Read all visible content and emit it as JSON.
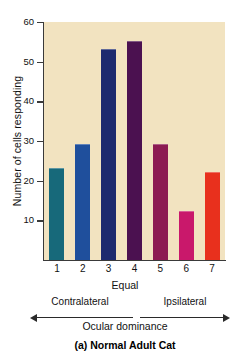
{
  "chart_data": {
    "type": "bar",
    "title": "",
    "caption": "(a)  Normal Adult Cat",
    "xlabel": "Ocular dominance",
    "ylabel": "Number of cells responding",
    "categories": [
      "1",
      "2",
      "3",
      "4",
      "5",
      "6",
      "7"
    ],
    "values": [
      23,
      29,
      53,
      55,
      29,
      12,
      22
    ],
    "bar_colors": [
      "#17697a",
      "#1f4f9c",
      "#1d2a6e",
      "#4b1150",
      "#8c1b52",
      "#c9186b",
      "#e8301d"
    ],
    "ylim": [
      0,
      60
    ],
    "yticks": [
      10,
      20,
      30,
      40,
      50,
      60
    ],
    "ytick_labels": [
      "10",
      "20",
      "30",
      "40",
      "50",
      "60"
    ],
    "grid": false,
    "legend": "none",
    "plot_background": "#f2e3c0",
    "axis_color": "#3a3a3a",
    "annotations": {
      "center_tick": "Equal",
      "left_direction": "Contralateral",
      "right_direction": "Ipsilateral"
    }
  }
}
